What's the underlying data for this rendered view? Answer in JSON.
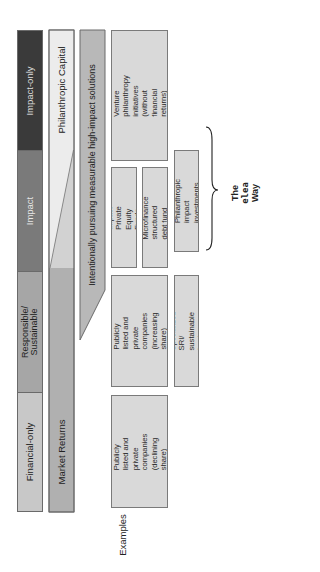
{
  "spectrum": {
    "segments": [
      {
        "label": "Impact-only",
        "color": "#3a3a3a",
        "text_color": "#dddddd"
      },
      {
        "label": "Impact",
        "color": "#7a7a7a",
        "text_color": "#e6e6e6"
      },
      {
        "label": "Responsible/\nSustainable",
        "color": "#a6a6a6",
        "text_color": "#222222"
      },
      {
        "label": "Financial-only",
        "color": "#c8c8c8",
        "text_color": "#222222"
      }
    ]
  },
  "capital_bars": {
    "philanthropic": {
      "label": "Philanthropic Capital",
      "color": "#ececec"
    },
    "market": {
      "label": "Market Returns",
      "color": "#b0b0b0"
    },
    "solutions": {
      "label": "Intentionally pursuing measurable high-impact solutions",
      "color": "#b8b8b8"
    }
  },
  "examples": {
    "label": "Examples",
    "items": [
      {
        "id": "venture",
        "text": "Venture philanthropy\ninitiatives (without\nfinancial returns)"
      },
      {
        "id": "impact-pe",
        "text": "Impact Private Equity\nFunds"
      },
      {
        "id": "microfinance",
        "text": "Microfinance\nstructured debt fund"
      },
      {
        "id": "philanthropic-impact",
        "text": "Philanthropic impact\ninvestments"
      },
      {
        "id": "public-increasing",
        "text": "Publicly listed and\nprivate companies\n(increasing share)"
      },
      {
        "id": "sri",
        "text": "Specialized SRI/\nsustainable funds"
      },
      {
        "id": "public-declining",
        "text": "Publicly listed and\nprivate companies\n(declining share)"
      }
    ]
  },
  "callout": {
    "line1": "The",
    "line2": "elea",
    "line3": "Way"
  }
}
